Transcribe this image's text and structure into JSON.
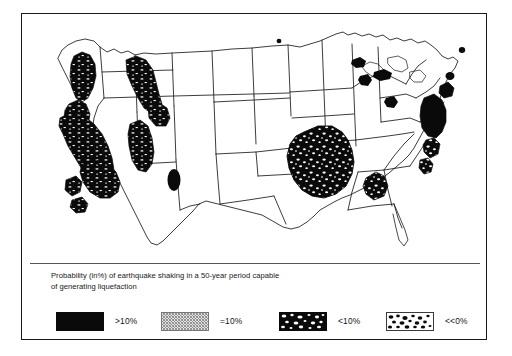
{
  "figure": {
    "caption_line_1": "Probability (in%) of earthquake shaking in a 50-year period capable",
    "caption_line_2": "of generating liquefaction",
    "background_color": "#ffffff",
    "frame_color": "#1a1a1a",
    "ink_color": "#0a0a0a"
  },
  "map": {
    "name": "united-states-liquefaction-hazard-map",
    "region": "Contiguous United States",
    "outline_color": "#1a1a1a",
    "fill_color": "#ffffff"
  },
  "legend": {
    "entries": [
      {
        "label": ">10%",
        "pattern": "solid-black",
        "swatch_name": "legend-swatch-gt-10"
      },
      {
        "label": "=10%",
        "pattern": "diagonal-hatch",
        "swatch_name": "legend-swatch-eq-10"
      },
      {
        "label": "<10%",
        "pattern": "black-white-speckle",
        "swatch_name": "legend-swatch-lt-10"
      },
      {
        "label": "<<0%",
        "pattern": "white-black-speckle",
        "swatch_name": "legend-swatch-ll-0"
      }
    ]
  }
}
